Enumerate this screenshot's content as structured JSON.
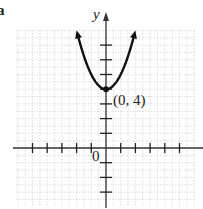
{
  "figure": {
    "corner_label": "a",
    "y_axis_label": "y",
    "origin_label": "0",
    "point_label": "(0, 4)"
  },
  "chart_data": {
    "type": "line",
    "title": "",
    "xlabel": "",
    "ylabel": "y",
    "function": "y = x^2 + 4",
    "vertex": {
      "x": 0,
      "y": 4,
      "label": "(0, 4)"
    },
    "x": [
      -2,
      -1.5,
      -1,
      -0.5,
      0,
      0.5,
      1,
      1.5,
      2
    ],
    "series": [
      {
        "name": "parabola",
        "values": [
          8,
          6.25,
          5,
          4.25,
          4,
          4.25,
          5,
          6.25,
          8
        ]
      }
    ],
    "xlim": [
      -6,
      6
    ],
    "ylim": [
      -4,
      9
    ],
    "x_ticks": [
      -5,
      -4,
      -3,
      -2,
      -1,
      1,
      2,
      3,
      4,
      5
    ],
    "y_ticks": [
      -3,
      -2,
      -1,
      1,
      2,
      3,
      4,
      5,
      6,
      7
    ],
    "grid": true,
    "legend": "none",
    "colors": {
      "curve": "#111111",
      "axes": "#333333",
      "grid": "#d0d0d0"
    }
  }
}
